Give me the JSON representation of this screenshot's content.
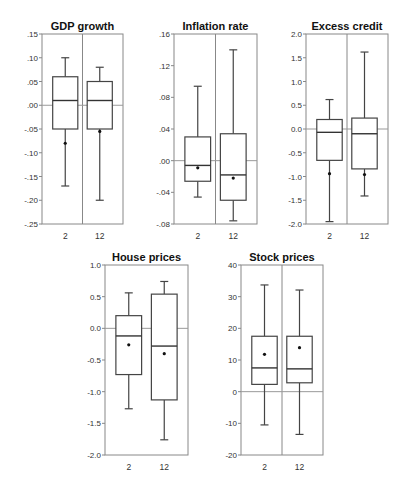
{
  "chart_data": [
    {
      "type": "box",
      "title": "GDP growth",
      "categories": [
        "2",
        "12"
      ],
      "ylim": [
        -0.25,
        0.15
      ],
      "yticks": [
        0.15,
        0.1,
        0.05,
        0.0,
        -0.05,
        -0.1,
        -0.15,
        -0.2,
        -0.25
      ],
      "ytick_labels": [
        ".15",
        ".10",
        ".05",
        ".00",
        "-.05",
        "-.10",
        "-.15",
        "-.20",
        "-.25"
      ],
      "divider": true,
      "series": [
        {
          "name": "2",
          "whisker_low": -0.17,
          "q1": -0.05,
          "median": 0.01,
          "q3": 0.06,
          "whisker_high": 0.1,
          "mean": -0.08
        },
        {
          "name": "12",
          "whisker_low": -0.2,
          "q1": -0.05,
          "median": 0.01,
          "q3": 0.05,
          "whisker_high": 0.08,
          "mean": -0.055
        }
      ],
      "frame": {
        "x": 42,
        "y": 34,
        "w": 81,
        "h": 190
      }
    },
    {
      "type": "box",
      "title": "Inflation rate",
      "categories": [
        "2",
        "12"
      ],
      "ylim": [
        -0.08,
        0.16
      ],
      "yticks": [
        0.16,
        0.12,
        0.08,
        0.04,
        0.0,
        -0.04,
        -0.08
      ],
      "ytick_labels": [
        ".16",
        ".12",
        ".08",
        ".04",
        ".00",
        "-.04",
        "-.08"
      ],
      "divider": true,
      "series": [
        {
          "name": "2",
          "whisker_low": -0.046,
          "q1": -0.026,
          "median": -0.006,
          "q3": 0.03,
          "whisker_high": 0.094,
          "mean": -0.009
        },
        {
          "name": "12",
          "whisker_low": -0.076,
          "q1": -0.05,
          "median": -0.018,
          "q3": 0.034,
          "whisker_high": 0.14,
          "mean": -0.022
        }
      ],
      "frame": {
        "x": 174,
        "y": 34,
        "w": 83,
        "h": 190
      }
    },
    {
      "type": "box",
      "title": "Excess credit",
      "categories": [
        "2",
        "12"
      ],
      "ylim": [
        -2.0,
        2.0
      ],
      "yticks": [
        2.0,
        1.5,
        1.0,
        0.5,
        0.0,
        -0.5,
        -1.0,
        -1.5,
        -2.0
      ],
      "ytick_labels": [
        "2.0",
        "1.5",
        "1.0",
        "0.5",
        "0.0",
        "-0.5",
        "-1.0",
        "-1.5",
        "-2.0"
      ],
      "divider": true,
      "series": [
        {
          "name": "2",
          "whisker_low": -1.95,
          "q1": -0.66,
          "median": -0.07,
          "q3": 0.2,
          "whisker_high": 0.62,
          "mean": -0.94
        },
        {
          "name": "12",
          "whisker_low": -1.41,
          "q1": -0.84,
          "median": -0.1,
          "q3": 0.23,
          "whisker_high": 1.62,
          "mean": -0.96
        }
      ],
      "frame": {
        "x": 306,
        "y": 34,
        "w": 82,
        "h": 190
      }
    },
    {
      "type": "box",
      "title": "House prices",
      "categories": [
        "2",
        "12"
      ],
      "ylim": [
        -2.0,
        1.0
      ],
      "yticks": [
        1.0,
        0.5,
        0.0,
        -0.5,
        -1.0,
        -1.5,
        -2.0
      ],
      "ytick_labels": [
        "1.0",
        "0.5",
        "0.0",
        "-0.5",
        "-1.0",
        "-1.5",
        "-2.0"
      ],
      "divider": false,
      "series": [
        {
          "name": "2",
          "whisker_low": -1.27,
          "q1": -0.73,
          "median": -0.12,
          "q3": 0.2,
          "whisker_high": 0.56,
          "mean": -0.26
        },
        {
          "name": "12",
          "whisker_low": -1.76,
          "q1": -1.13,
          "median": -0.28,
          "q3": 0.54,
          "whisker_high": 0.74,
          "mean": -0.4
        }
      ],
      "frame": {
        "x": 105,
        "y": 265,
        "w": 83,
        "h": 190
      }
    },
    {
      "type": "box",
      "title": "Stock prices",
      "categories": [
        "2",
        "12"
      ],
      "ylim": [
        -20,
        40
      ],
      "yticks": [
        40,
        30,
        20,
        10,
        0,
        -10,
        -20
      ],
      "ytick_labels": [
        "40",
        "30",
        "20",
        "10",
        "0",
        "-10",
        "-20"
      ],
      "divider": true,
      "series": [
        {
          "name": "2",
          "whisker_low": -10.5,
          "q1": 2.3,
          "median": 7.5,
          "q3": 17.5,
          "whisker_high": 33.7,
          "mean": 11.8
        },
        {
          "name": "12",
          "whisker_low": -13.5,
          "q1": 2.8,
          "median": 7.2,
          "q3": 17.5,
          "whisker_high": 32.1,
          "mean": 13.9
        }
      ],
      "frame": {
        "x": 241,
        "y": 265,
        "w": 82,
        "h": 190
      }
    }
  ]
}
